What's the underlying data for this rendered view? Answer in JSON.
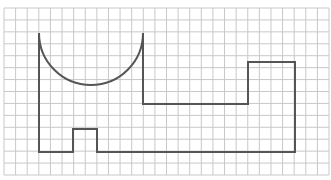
{
  "diagram": {
    "type": "grid-figure",
    "grid": {
      "x_start": 4,
      "x_end": 329,
      "y_start": 8,
      "y_end": 175,
      "columns": 28,
      "rows": 14,
      "line_color": "#c8c8c8"
    },
    "shape": {
      "stroke_color": "#555555",
      "stroke_width": 2,
      "arc": {
        "cx": 91,
        "cy": 33,
        "r": 52,
        "start": [
          39,
          33
        ],
        "end": [
          143,
          33
        ]
      },
      "outline_points": [
        [
          143,
          33
        ],
        [
          143,
          104
        ],
        [
          248,
          104
        ],
        [
          248,
          62
        ],
        [
          295,
          62
        ],
        [
          295,
          152
        ],
        [
          97,
          152
        ],
        [
          97,
          129
        ],
        [
          73,
          129
        ],
        [
          73,
          152
        ],
        [
          39,
          152
        ],
        [
          39,
          33
        ]
      ]
    }
  }
}
